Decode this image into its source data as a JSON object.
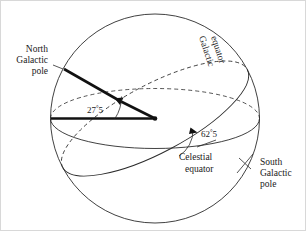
{
  "figure": {
    "labels": {
      "north_galactic_pole": [
        "North",
        "Galactic",
        "pole"
      ],
      "south_galactic_pole": [
        "South",
        "Galactic",
        "pole"
      ],
      "galactic_equator": [
        "Galactic",
        "equator"
      ],
      "celestial_equator": [
        "Celestial",
        "equator"
      ]
    },
    "angles": {
      "pole_tilt": {
        "value": "27",
        "decimal": "5",
        "unit": "°",
        "display": "27°.5"
      },
      "equator_inclination": {
        "value": "62",
        "decimal": "5",
        "unit": "°",
        "display": "62°.5"
      }
    },
    "colors": {
      "background": "#ffffff",
      "line": "#2b2b2b",
      "arrow": "#111111",
      "text": "#1a1a1a"
    }
  }
}
